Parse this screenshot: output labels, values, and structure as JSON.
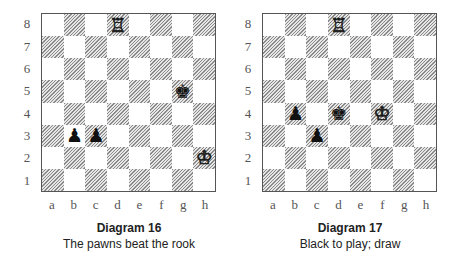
{
  "diagrams": [
    {
      "title": "Diagram 16",
      "caption": "The pawns beat the rook",
      "pieces": [
        {
          "square": "d8",
          "piece": "rook",
          "color": "white",
          "glyph": "♖"
        },
        {
          "square": "g5",
          "piece": "king",
          "color": "black",
          "glyph": "♚"
        },
        {
          "square": "b3",
          "piece": "pawn",
          "color": "black",
          "glyph": "♟"
        },
        {
          "square": "c3",
          "piece": "pawn",
          "color": "black",
          "glyph": "♟"
        },
        {
          "square": "h2",
          "piece": "king",
          "color": "white",
          "glyph": "♔"
        }
      ]
    },
    {
      "title": "Diagram 17",
      "caption": "Black to play; draw",
      "pieces": [
        {
          "square": "d8",
          "piece": "rook",
          "color": "white",
          "glyph": "♖"
        },
        {
          "square": "b4",
          "piece": "pawn",
          "color": "black",
          "glyph": "♟"
        },
        {
          "square": "d4",
          "piece": "king",
          "color": "black",
          "glyph": "♚"
        },
        {
          "square": "f4",
          "piece": "king",
          "color": "white",
          "glyph": "♔"
        },
        {
          "square": "c3",
          "piece": "pawn",
          "color": "black",
          "glyph": "♟"
        }
      ]
    }
  ],
  "ranks": [
    "8",
    "7",
    "6",
    "5",
    "4",
    "3",
    "2",
    "1"
  ],
  "files": [
    "a",
    "b",
    "c",
    "d",
    "e",
    "f",
    "g",
    "h"
  ]
}
